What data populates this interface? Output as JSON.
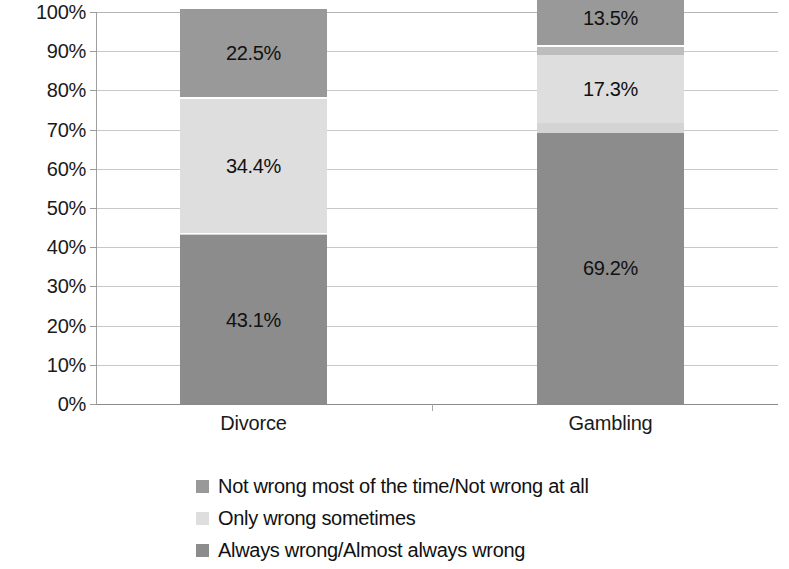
{
  "chart_data": {
    "type": "bar",
    "title": "",
    "subtitle": "",
    "xlabel": "",
    "ylabel": "",
    "stacked": true,
    "stack_mode": "percent",
    "orientation": "vertical",
    "grid": true,
    "legend_position": "bottom",
    "ylim": [
      0,
      100
    ],
    "ytick_labels": [
      "100%",
      "90%",
      "80%",
      "70%",
      "60%",
      "50%",
      "40%",
      "30%",
      "20%",
      "10%",
      "0%"
    ],
    "ytick_values": [
      100,
      90,
      80,
      70,
      60,
      50,
      40,
      30,
      20,
      10,
      0
    ],
    "categories": [
      "Divorce",
      "Gambling"
    ],
    "series": [
      {
        "name": "Always wrong/Almost always wrong",
        "color": "#8c8c8c",
        "values": [
          43.1,
          69.2
        ],
        "labels": [
          "43.1%",
          "69.2%"
        ]
      },
      {
        "name": "gap-segment-lower",
        "color": "#d4d4d4",
        "values": [
          0.4,
          2.6
        ],
        "labels": [
          "",
          ""
        ]
      },
      {
        "name": "Only wrong sometimes",
        "color": "#dedede",
        "values": [
          34.4,
          17.3
        ],
        "labels": [
          "34.4%",
          "17.3%"
        ]
      },
      {
        "name": "gap-segment-upper",
        "color": "#bdbdbd",
        "values": [
          -0.4,
          -2.6
        ],
        "labels": [
          "",
          ""
        ]
      },
      {
        "name": "Not wrong most of the time/Not wrong at all",
        "color": "#999999",
        "values": [
          22.5,
          13.5
        ],
        "labels": [
          "22.5%",
          "13.5%"
        ]
      }
    ],
    "legend": [
      {
        "label": "Not wrong most of the time/Not wrong at all",
        "color": "#999999"
      },
      {
        "label": "Only wrong sometimes",
        "color": "#dedede"
      },
      {
        "label": "Always wrong/Almost always wrong",
        "color": "#8c8c8c"
      }
    ]
  }
}
